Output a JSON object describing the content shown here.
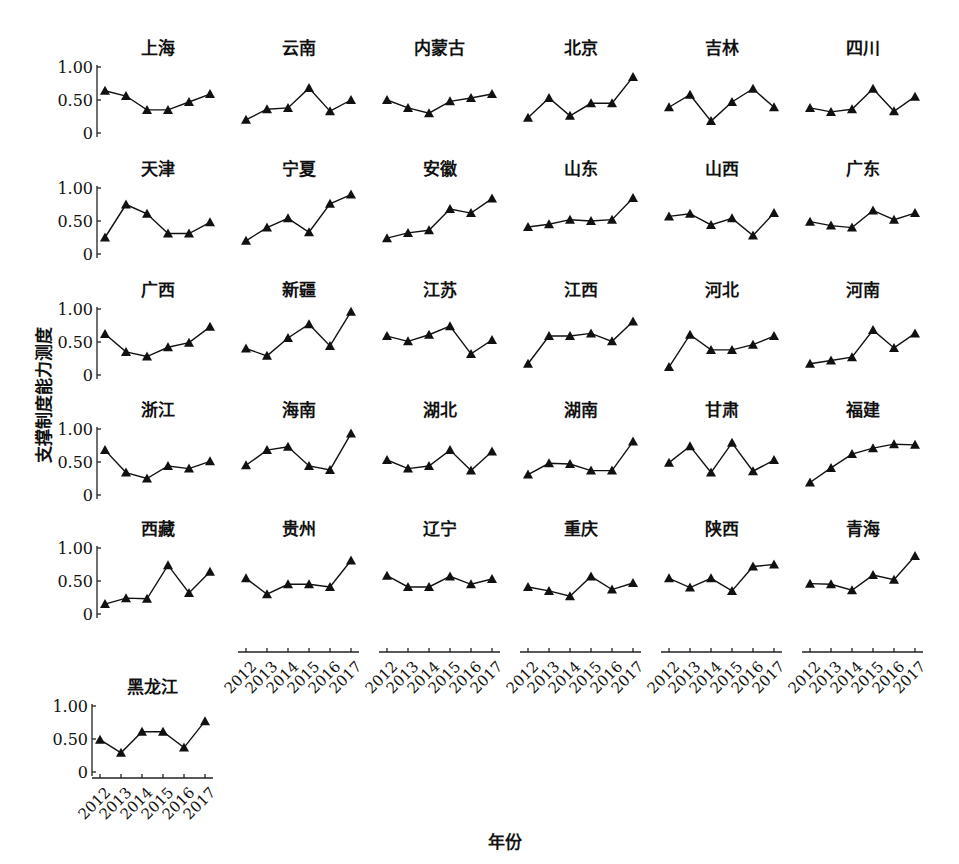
{
  "chart_data": {
    "type": "line",
    "layout": "small-multiples",
    "title": "",
    "xlabel": "年份",
    "ylabel": "支撑制度能力测度",
    "x": [
      "2012",
      "2013",
      "2014",
      "2015",
      "2016",
      "2017"
    ],
    "ylim": [
      0,
      1.0
    ],
    "yticks": [
      0,
      0.5,
      1.0
    ],
    "ytick_labels": [
      "0",
      "0.50",
      "1.00"
    ],
    "marker": "triangle",
    "grid": false,
    "legend": "none",
    "panels": [
      {
        "name": "上海",
        "values": [
          0.64,
          0.56,
          0.35,
          0.35,
          0.47,
          0.59
        ]
      },
      {
        "name": "云南",
        "values": [
          0.2,
          0.36,
          0.38,
          0.68,
          0.33,
          0.5
        ]
      },
      {
        "name": "内蒙古",
        "values": [
          0.5,
          0.38,
          0.3,
          0.48,
          0.53,
          0.59
        ]
      },
      {
        "name": "北京",
        "values": [
          0.23,
          0.53,
          0.26,
          0.45,
          0.45,
          0.85
        ]
      },
      {
        "name": "吉林",
        "values": [
          0.39,
          0.58,
          0.18,
          0.47,
          0.67,
          0.39
        ]
      },
      {
        "name": "四川",
        "values": [
          0.38,
          0.32,
          0.36,
          0.67,
          0.33,
          0.55
        ]
      },
      {
        "name": "天津",
        "values": [
          0.25,
          0.75,
          0.61,
          0.31,
          0.31,
          0.48
        ]
      },
      {
        "name": "宁夏",
        "values": [
          0.2,
          0.4,
          0.54,
          0.33,
          0.76,
          0.9
        ]
      },
      {
        "name": "安徽",
        "values": [
          0.24,
          0.32,
          0.36,
          0.68,
          0.62,
          0.84
        ]
      },
      {
        "name": "山东",
        "values": [
          0.41,
          0.45,
          0.52,
          0.5,
          0.52,
          0.85
        ]
      },
      {
        "name": "山西",
        "values": [
          0.57,
          0.61,
          0.44,
          0.54,
          0.28,
          0.62
        ]
      },
      {
        "name": "广东",
        "values": [
          0.49,
          0.43,
          0.4,
          0.66,
          0.52,
          0.62
        ]
      },
      {
        "name": "广西",
        "values": [
          0.62,
          0.35,
          0.28,
          0.42,
          0.49,
          0.73
        ]
      },
      {
        "name": "新疆",
        "values": [
          0.4,
          0.29,
          0.56,
          0.77,
          0.44,
          0.96
        ]
      },
      {
        "name": "江苏",
        "values": [
          0.59,
          0.51,
          0.61,
          0.74,
          0.32,
          0.53
        ]
      },
      {
        "name": "江西",
        "values": [
          0.17,
          0.59,
          0.59,
          0.63,
          0.51,
          0.81
        ]
      },
      {
        "name": "河北",
        "values": [
          0.12,
          0.61,
          0.38,
          0.38,
          0.46,
          0.59
        ]
      },
      {
        "name": "河南",
        "values": [
          0.17,
          0.22,
          0.27,
          0.68,
          0.41,
          0.63
        ]
      },
      {
        "name": "浙江",
        "values": [
          0.68,
          0.34,
          0.25,
          0.44,
          0.4,
          0.51
        ]
      },
      {
        "name": "海南",
        "values": [
          0.45,
          0.68,
          0.73,
          0.44,
          0.38,
          0.93
        ]
      },
      {
        "name": "湖北",
        "values": [
          0.53,
          0.4,
          0.44,
          0.68,
          0.37,
          0.66
        ]
      },
      {
        "name": "湖南",
        "values": [
          0.31,
          0.48,
          0.47,
          0.37,
          0.37,
          0.81
        ]
      },
      {
        "name": "甘肃",
        "values": [
          0.49,
          0.74,
          0.34,
          0.79,
          0.36,
          0.53
        ]
      },
      {
        "name": "福建",
        "values": [
          0.19,
          0.41,
          0.62,
          0.71,
          0.77,
          0.76
        ]
      },
      {
        "name": "西藏",
        "values": [
          0.15,
          0.24,
          0.23,
          0.74,
          0.32,
          0.64
        ]
      },
      {
        "name": "贵州",
        "values": [
          0.54,
          0.3,
          0.45,
          0.45,
          0.41,
          0.81
        ]
      },
      {
        "name": "辽宁",
        "values": [
          0.58,
          0.41,
          0.41,
          0.57,
          0.45,
          0.53
        ]
      },
      {
        "name": "重庆",
        "values": [
          0.41,
          0.35,
          0.27,
          0.57,
          0.37,
          0.47
        ]
      },
      {
        "name": "陕西",
        "values": [
          0.54,
          0.4,
          0.54,
          0.35,
          0.72,
          0.75
        ]
      },
      {
        "name": "青海",
        "values": [
          0.46,
          0.45,
          0.36,
          0.59,
          0.52,
          0.88
        ]
      },
      {
        "name": "黑龙江",
        "values": [
          0.49,
          0.29,
          0.61,
          0.61,
          0.37,
          0.77
        ]
      }
    ]
  }
}
